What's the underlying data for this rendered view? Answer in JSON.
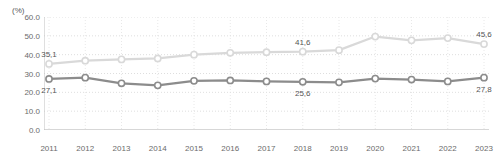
{
  "chart_data": {
    "type": "line",
    "title": "",
    "subtitle": "",
    "xlabel": "",
    "ylabel": "",
    "unit_label": "(%)",
    "categories": [
      "2011",
      "2012",
      "2013",
      "2014",
      "2015",
      "2016",
      "2017",
      "2018",
      "2019",
      "2020",
      "2021",
      "2022",
      "2023"
    ],
    "ylim": [
      0.0,
      60.0
    ],
    "yticks": [
      "0.0",
      "10.0",
      "20.0",
      "30.0",
      "40.0",
      "50.0",
      "60.0"
    ],
    "ytick_values": [
      0.0,
      10.0,
      20.0,
      30.0,
      40.0,
      50.0,
      60.0
    ],
    "grid": true,
    "grid_style": "dotted-horizontal",
    "legend": "none",
    "series": [
      {
        "name": "upper-series",
        "color": "#d9d9d9",
        "marker": "open-circle",
        "values": [
          35.1,
          36.8,
          37.5,
          38.0,
          40.0,
          41.0,
          41.3,
          41.6,
          42.4,
          49.6,
          47.6,
          48.8,
          45.6
        ],
        "labels": [
          {
            "index": 0,
            "text": "35,1",
            "position": "above"
          },
          {
            "index": 7,
            "text": "41,6",
            "position": "above"
          },
          {
            "index": 12,
            "text": "45,6",
            "position": "above"
          }
        ]
      },
      {
        "name": "lower-series",
        "color": "#8c8c8c",
        "marker": "open-circle",
        "values": [
          27.1,
          27.8,
          24.8,
          23.7,
          26.1,
          26.3,
          25.8,
          25.6,
          25.3,
          27.3,
          26.8,
          25.8,
          27.8
        ],
        "labels": [
          {
            "index": 0,
            "text": "27,1",
            "position": "below"
          },
          {
            "index": 7,
            "text": "25,6",
            "position": "below"
          },
          {
            "index": 12,
            "text": "27,8",
            "position": "below"
          }
        ]
      }
    ]
  }
}
